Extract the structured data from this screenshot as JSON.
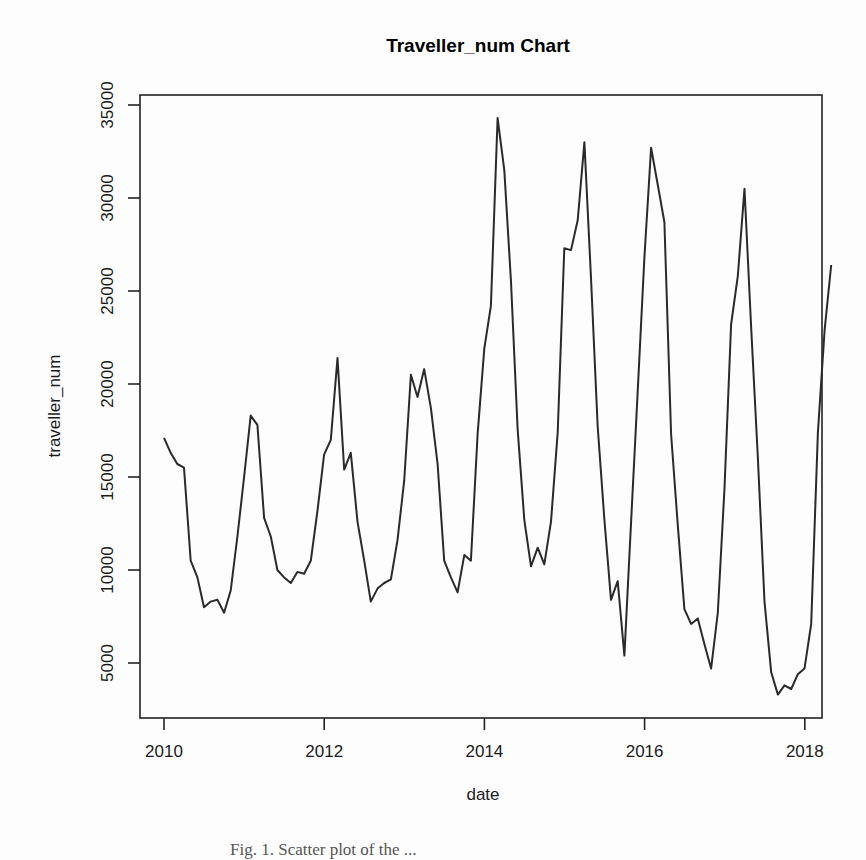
{
  "chart_data": {
    "type": "line",
    "title": "Traveller_num Chart",
    "xlabel": "date",
    "ylabel": "traveller_num",
    "xlim": [
      2009.85,
      2018.2
    ],
    "ylim": [
      2000,
      35500
    ],
    "grid": false,
    "legend": null,
    "x_ticks": [
      2010,
      2012,
      2014,
      2016,
      2018
    ],
    "x_tick_labels": [
      "2010",
      "2012",
      "2014",
      "2016",
      "2018"
    ],
    "y_ticks": [
      5000,
      10000,
      15000,
      20000,
      25000,
      30000,
      35000
    ],
    "y_tick_labels": [
      "5000",
      "10000",
      "15000",
      "20000",
      "25000",
      "30000",
      "35000"
    ],
    "x_start": 2010.0,
    "x_step": 0.0833,
    "values": [
      17100,
      16300,
      15700,
      15500,
      10500,
      9600,
      8000,
      8300,
      8400,
      7700,
      8900,
      11800,
      15000,
      18300,
      17800,
      12800,
      11800,
      10000,
      9600,
      9300,
      9900,
      9800,
      10500,
      13200,
      16200,
      17000,
      21400,
      15400,
      16300,
      12600,
      10500,
      8300,
      9000,
      9300,
      9500,
      11600,
      14800,
      20500,
      19300,
      20800,
      18700,
      15700,
      10500,
      9600,
      8800,
      10800,
      10500,
      17300,
      21900,
      24200,
      34300,
      31500,
      25500,
      17600,
      12700,
      10200,
      11200,
      10300,
      12600,
      17400,
      27300,
      27200,
      28800,
      33000,
      25700,
      17700,
      12700,
      8400,
      9400,
      5400,
      12600,
      19600,
      26800,
      32700,
      30700,
      28700,
      17300,
      12400,
      7900,
      7100,
      7400,
      6000,
      4700,
      7700,
      14400,
      23200,
      25800,
      30500,
      23000,
      16100,
      8300,
      4500,
      3300,
      3800,
      3600,
      4400,
      4700,
      7100,
      17400,
      22900,
      26400
    ],
    "note": "Values estimated from pixel positions; monthly series Jan 2010 - ~Nov 2017"
  },
  "caption": "Fig. 1.  Scatter plot of the ..."
}
